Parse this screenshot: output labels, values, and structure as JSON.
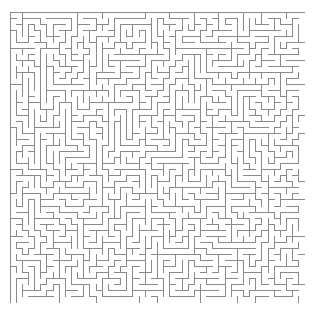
{
  "figure": {
    "kind": "maze-puzzle",
    "title": "",
    "canvas_width": 319,
    "canvas_height": 310,
    "background_color": "#ffffff"
  },
  "maze": {
    "columns": 48,
    "rows": 48,
    "cell_size": 6.15,
    "origin_x": 10,
    "origin_y": 12,
    "width": 295,
    "height": 291,
    "wall_color": "#8a8a8a",
    "wall_thickness": 1,
    "passage_color": "#ffffff",
    "border": "closed",
    "entrance": "none",
    "exit": "none",
    "style": "perfect-maze",
    "seed": 20250419
  }
}
